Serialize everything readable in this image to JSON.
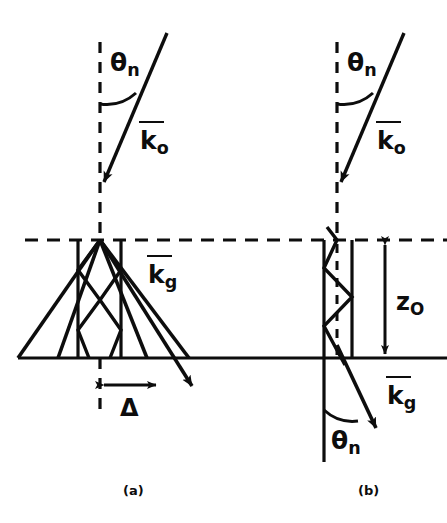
{
  "figure": {
    "type": "optical-ray-diagram",
    "stroke_color": "#0d0d0d",
    "background": "#ffffff",
    "panels": [
      {
        "id": "a",
        "caption": "(a)",
        "labels": {
          "incident_angle": "θ",
          "incident_angle_sub": "n",
          "incident_wavevector": "k",
          "incident_wavevector_sub": "o",
          "refracted_wavevector": "k",
          "refracted_wavevector_sub": "g",
          "displacement": "Δ"
        }
      },
      {
        "id": "b",
        "caption": "(b)",
        "labels": {
          "incident_angle": "θ",
          "incident_angle_sub": "n",
          "incident_wavevector": "k",
          "incident_wavevector_sub": "o",
          "exit_wavevector": "k",
          "exit_wavevector_sub": "g",
          "exit_angle": "θ",
          "exit_angle_sub": "n",
          "depth": "z",
          "depth_sub": "O"
        }
      }
    ]
  }
}
